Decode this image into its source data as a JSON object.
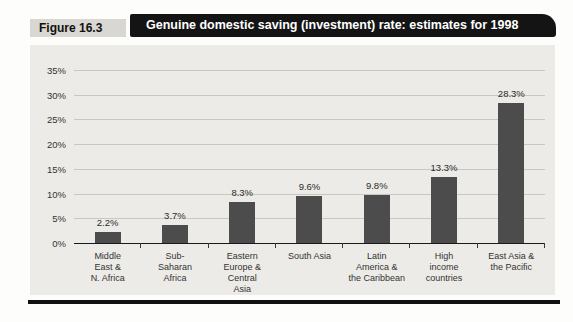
{
  "figure": {
    "label": "Figure 16.3",
    "title": "Genuine domestic saving (investment) rate: estimates for 1998"
  },
  "colors": {
    "bar": "#4c4c4c",
    "panel_background": "#edebe7",
    "banner_background": "#141414",
    "gridline": "#c9c7c2"
  },
  "chart_data": {
    "type": "bar",
    "title": "Genuine domestic saving (investment) rate: estimates for 1998",
    "categories": [
      "Middle East & N. Africa",
      "Sub-Saharan Africa",
      "Eastern Europe & Central Asia",
      "South Asia",
      "Latin America & the Caribbean",
      "High income countries",
      "East Asia & the Pacific"
    ],
    "category_labels": [
      "Middle\nEast &\nN. Africa",
      "Sub-\nSaharan\nAfrica",
      "Eastern\nEurope &\nCentral\nAsia",
      "South Asia",
      "Latin\nAmerica &\nthe Caribbean",
      "High\nincome\ncountries",
      "East Asia &\nthe Pacific"
    ],
    "values": [
      2.2,
      3.7,
      8.3,
      9.6,
      9.8,
      13.3,
      28.3
    ],
    "data_labels": [
      "2.2%",
      "3.7%",
      "8.3%",
      "9.6%",
      "9.8%",
      "13.3%",
      "28.3%"
    ],
    "yticks_top_down": [
      "35%",
      "30%",
      "25%",
      "20%",
      "15%",
      "10%",
      "5%",
      "0%"
    ],
    "ylim": [
      0,
      35
    ],
    "ytick_step": 5,
    "grid": true,
    "legend": "none",
    "xlabel": "",
    "ylabel": ""
  }
}
